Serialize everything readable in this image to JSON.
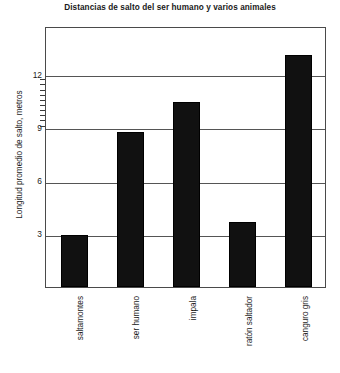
{
  "chart_data": {
    "type": "bar",
    "title": "Distancias de salto del ser humano y varios animales",
    "xlabel": "",
    "ylabel": "Longitud promedio de salto, metros",
    "categories": [
      "saltamontes",
      "ser humano",
      "impala",
      "ratón saltador",
      "canguro gris"
    ],
    "values": [
      3.0,
      8.8,
      10.5,
      3.7,
      13.1
    ],
    "yticks": [
      3,
      6,
      9,
      12
    ],
    "ytick_labels": [
      "3",
      "6",
      "9",
      "12"
    ],
    "ylim": [
      0,
      14.8
    ],
    "grid": "horizontal",
    "legend": "none",
    "bar_color": "#111111",
    "axis_color": "#4a4a4a",
    "minor_ticks_between": "9-12"
  },
  "title": "Distancias de salto del ser humano y varios animales",
  "axes": {
    "y_title": "Longitud promedio de salto, metros",
    "y_ticks": [
      {
        "label": "12",
        "value": 12
      },
      {
        "label": "9",
        "value": 9
      },
      {
        "label": "6",
        "value": 6
      },
      {
        "label": "3",
        "value": 3
      }
    ],
    "x_categories": [
      {
        "label": "saltamontes",
        "value": 3.0
      },
      {
        "label": "ser humano",
        "value": 8.8
      },
      {
        "label": "impala",
        "value": 10.5
      },
      {
        "label": "ratón saltador",
        "value": 3.7
      },
      {
        "label": "canguro gris",
        "value": 13.1
      }
    ]
  }
}
